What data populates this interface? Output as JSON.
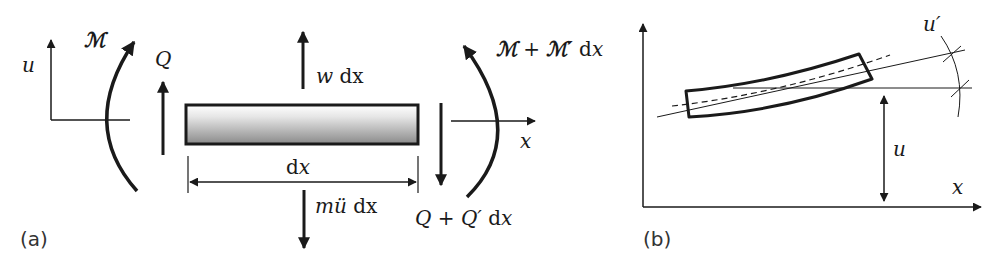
{
  "figure": {
    "panel_a": {
      "label": "(a)",
      "axis_u": "u",
      "axis_x": "x",
      "moment_left": "ℳ",
      "moment_right_base": "ℳ",
      "moment_right_plus": " + ",
      "moment_right_deriv": "ℳ′",
      "moment_right_dx": " dx",
      "shear_left": "Q",
      "shear_right_base": "Q",
      "shear_right_plus": " + ",
      "shear_right_deriv": "Q′",
      "shear_right_dx": "dx",
      "load": "w",
      "load_dx": " dx",
      "inertia": "mü",
      "inertia_dx": " dx",
      "length": "dx"
    },
    "panel_b": {
      "label": "(b)",
      "axis_x": "x",
      "displacement": "u",
      "slope": "u′"
    },
    "colors": {
      "stroke": "#1a1a1a",
      "beam_fill_top": "#ffffff",
      "beam_fill_bottom": "#8a8a8a"
    }
  }
}
